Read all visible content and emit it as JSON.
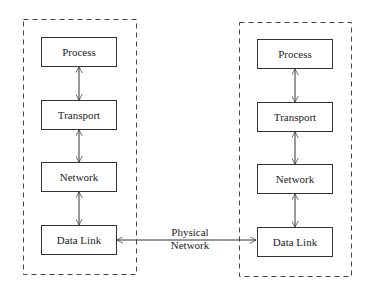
{
  "diagram": {
    "type": "protocol-stack",
    "left_stack": {
      "layers": [
        "Process",
        "Transport",
        "Network",
        "Data Link"
      ]
    },
    "right_stack": {
      "layers": [
        "Process",
        "Transport",
        "Network",
        "Data Link"
      ]
    },
    "link": {
      "line1": "Physical",
      "line2": "Network"
    },
    "colors": {
      "stroke": "#333333",
      "background": "#ffffff"
    }
  }
}
